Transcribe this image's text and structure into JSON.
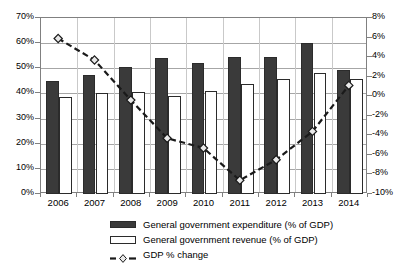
{
  "chart_data": {
    "type": "bar",
    "title": "",
    "xlabel": "",
    "ylabel": "",
    "grid": true,
    "legend_position": "bottom-center",
    "categories": [
      "2006",
      "2007",
      "2008",
      "2009",
      "2010",
      "2011",
      "2012",
      "2013",
      "2014"
    ],
    "axes": {
      "left": {
        "label": "",
        "ylim": [
          0,
          70
        ],
        "tick_step": 10,
        "ticks": [
          "0%",
          "10%",
          "20%",
          "30%",
          "40%",
          "50%",
          "60%",
          "70%"
        ],
        "tick_values": [
          0,
          10,
          20,
          30,
          40,
          50,
          60,
          70
        ],
        "unit": "% of GDP"
      },
      "right": {
        "label": "",
        "ylim": [
          -10,
          8
        ],
        "tick_step": 2,
        "ticks": [
          "-10%",
          "-8%",
          "-6%",
          "-4%",
          "-2%",
          "0%",
          "2%",
          "4%",
          "6%",
          "8%"
        ],
        "tick_values": [
          -10,
          -8,
          -6,
          -4,
          -2,
          0,
          2,
          4,
          6,
          8
        ],
        "unit": "% change"
      }
    },
    "series": [
      {
        "name": "General government expenditure (% of GDP)",
        "type": "bar",
        "axis": "left",
        "color": "#3a3a3a",
        "style": "filled",
        "values": [
          45.1,
          47.2,
          50.4,
          54.0,
          52.1,
          54.3,
          54.5,
          60.0,
          49.3
        ]
      },
      {
        "name": "General government revenue (% of GDP)",
        "type": "bar",
        "axis": "left",
        "color": "#ffffff",
        "style": "outlined",
        "values": [
          38.7,
          40.1,
          40.4,
          38.8,
          41.0,
          43.8,
          45.9,
          48.0,
          45.9
        ]
      },
      {
        "name": "GDP % change",
        "type": "line",
        "axis": "right",
        "color": "#1a1a1a",
        "style": "dashed-diamond-marker",
        "values": [
          5.8,
          3.6,
          -0.5,
          -4.4,
          -5.4,
          -8.7,
          -6.6,
          -3.7,
          1.0
        ]
      }
    ],
    "legend": [
      {
        "label": "General government expenditure (% of GDP)",
        "marker": "filled-bar-swatch"
      },
      {
        "label": "General government revenue (% of GDP)",
        "marker": "outlined-bar-swatch"
      },
      {
        "label": "GDP % change",
        "marker": "dashed-line-diamond"
      }
    ]
  }
}
